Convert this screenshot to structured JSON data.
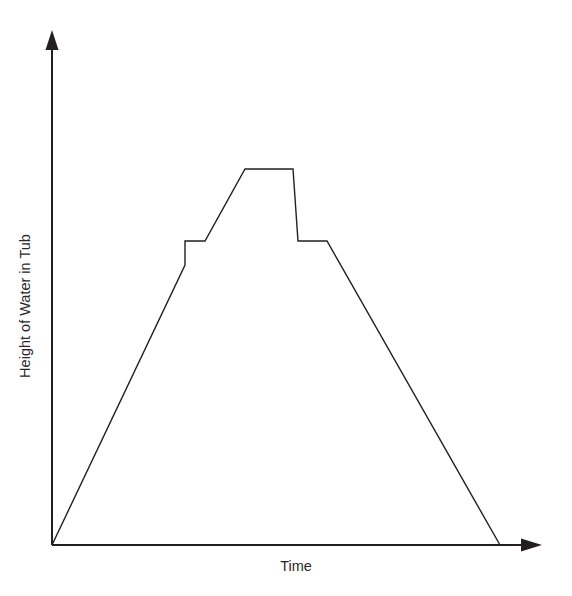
{
  "caption": {
    "text": "tub at different times."
  },
  "chart_data": {
    "type": "line",
    "title": "",
    "xlabel": "Time",
    "ylabel": "Height of Water in Tub",
    "xlim": [
      0,
      100
    ],
    "ylim": [
      0,
      100
    ],
    "grid": false,
    "legend": false,
    "axis_arrows": true,
    "tick_labels": {
      "x": [],
      "y": []
    },
    "series": [
      {
        "name": "Height of water in tub",
        "line_color": "#231f20",
        "line_width": 1.4,
        "x": [
          0,
          29.7,
          29.7,
          34.2,
          43.1,
          53.8,
          54.9,
          61.4,
          100.0
        ],
        "y": [
          0,
          54.4,
          59.1,
          59.1,
          73.1,
          73.1,
          59.1,
          59.1,
          0
        ],
        "points_px": [
          {
            "x": 52,
            "y": 545
          },
          {
            "x": 185,
            "y": 265
          },
          {
            "x": 185,
            "y": 241
          },
          {
            "x": 205,
            "y": 241
          },
          {
            "x": 245,
            "y": 169
          },
          {
            "x": 293,
            "y": 169
          },
          {
            "x": 298,
            "y": 241
          },
          {
            "x": 327,
            "y": 241
          },
          {
            "x": 500,
            "y": 545
          }
        ],
        "description": "Water rises steadily, pauses briefly, rises again to a maximum, holds, drops sharply, holds briefly, then drains steadily to empty."
      }
    ],
    "axes": {
      "origin_px": {
        "x": 52,
        "y": 545
      },
      "x_axis_end_px": {
        "x": 540,
        "y": 545
      },
      "y_axis_end_px": {
        "x": 52,
        "y": 32
      },
      "color": "#231f20"
    }
  }
}
